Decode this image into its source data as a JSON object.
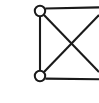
{
  "figure": {
    "title": "",
    "caption": "",
    "type": "graph-diagram",
    "background_color": "#ffffff",
    "stroke_color": "#1a1a1a",
    "node_fill_color": "#ffffff",
    "canvas": {
      "width": 99,
      "height": 103
    }
  },
  "graph": {
    "node_radius": 5.2,
    "node_stroke_width": 2.0,
    "edge_stroke_width": 2.1,
    "nodes": [
      {
        "id": "v-top-left",
        "label": "",
        "cx": 40,
        "cy": 11,
        "visible": true,
        "shape": "circle",
        "filled": false
      },
      {
        "id": "v-bottom-left",
        "label": "",
        "cx": 40,
        "cy": 76,
        "visible": true,
        "shape": "circle",
        "filled": false
      }
    ],
    "edges": [
      {
        "id": "edge-left-vertical",
        "from": "v-top-left",
        "to": "v-bottom-left",
        "x1": 40,
        "y1": 16.4,
        "x2": 40,
        "y2": 70.6,
        "clipped": false
      },
      {
        "id": "edge-top-horizontal",
        "from": "v-top-left",
        "to": "v-top-right-offscreen",
        "x1": 45.3,
        "y1": 8.5,
        "x2": 99,
        "y2": 7.4,
        "clipped": true
      },
      {
        "id": "edge-bottom-horizontal",
        "from": "v-bottom-left",
        "to": "v-bottom-right-offscreen",
        "x1": 45.3,
        "y1": 78.6,
        "x2": 99,
        "y2": 79.2,
        "clipped": true
      },
      {
        "id": "edge-diagonal-down",
        "from": "v-top-left",
        "to": "v-bottom-right-offscreen",
        "x1": 44.0,
        "y1": 15.0,
        "x2": 99,
        "y2": 72.0,
        "clipped": true
      },
      {
        "id": "edge-diagonal-up",
        "from": "v-bottom-left",
        "to": "v-top-right-offscreen",
        "x1": 44.0,
        "y1": 72.0,
        "x2": 99,
        "y2": 15.0,
        "clipped": true
      }
    ],
    "crossing_point": {
      "x": 75,
      "y": 44
    }
  }
}
